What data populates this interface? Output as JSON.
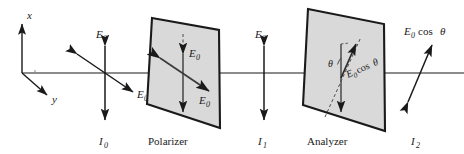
{
  "figure": {
    "name": "polarizer-analyzer-malus-law-diagram",
    "background_color": "#ffffff",
    "stroke_color": "#1a1a1a",
    "plate_fill_color": "#d9d9d9",
    "plate_edge_color": "#1a1a1a"
  },
  "axes": {
    "x_label": "x",
    "y_label": "y"
  },
  "beam": {
    "label": "optical-axis-line"
  },
  "stage_incident": {
    "field_label_vertical": "E",
    "field_label_vertical_sub": "0",
    "field_label_diagonal": "E",
    "field_label_diagonal_sub": "0",
    "intensity_label": "I",
    "intensity_label_sub": "0"
  },
  "polarizer": {
    "name": "Polarizer",
    "field_label_vertical": "E",
    "field_label_vertical_sub": "0",
    "field_label_diagonal": "E",
    "field_label_diagonal_sub": "0"
  },
  "stage_between": {
    "field_label": "E",
    "field_label_sub": "0",
    "intensity_label": "I",
    "intensity_label_sub": "1"
  },
  "analyzer": {
    "name": "Analyzer",
    "angle_label": "θ",
    "component_label_E": "E",
    "component_label_sub": "0",
    "component_label_cos": "cos",
    "component_label_theta": "θ"
  },
  "stage_transmitted": {
    "field_label_E": "E",
    "field_label_sub": "0",
    "field_label_cos": "cos",
    "field_label_theta": "θ",
    "intensity_label": "I",
    "intensity_label_sub": "2"
  }
}
